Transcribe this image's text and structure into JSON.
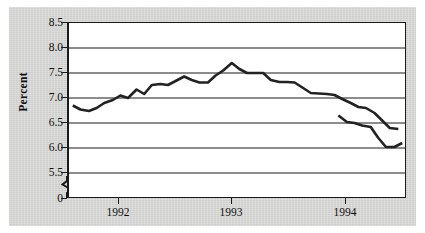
{
  "figure": {
    "name": "unemployment-rate-line-chart",
    "background_color": "#d6d6d4",
    "plot_background_color": "#ffffff",
    "line_color": "#222222",
    "axis_color": "#1a1a1a"
  },
  "chart_data": {
    "type": "line",
    "title": "",
    "xlabel": "",
    "ylabel": "Percent",
    "ylim": [
      5.25,
      8.5
    ],
    "yticks": [
      "0",
      "5.5",
      "6.0",
      "6.5",
      "7.0",
      "7.5",
      "8.0",
      "8.5"
    ],
    "ytick_values": [
      0,
      5.5,
      6.0,
      6.5,
      7.0,
      7.5,
      8.0,
      8.5
    ],
    "axis_break": true,
    "axis_break_between": [
      0,
      5.5
    ],
    "grid": "horizontal",
    "legend": "none",
    "xticks": [
      "1992",
      "1993",
      "1994"
    ],
    "xtick_values": [
      1992,
      1993,
      1994
    ],
    "xlim": [
      1991.25,
      1994.78
    ],
    "series": [
      {
        "name": "Unemployment rate",
        "break_after_index": 30,
        "x": [
          1991.29,
          1991.37,
          1991.46,
          1991.54,
          1991.62,
          1991.71,
          1991.79,
          1991.87,
          1991.96,
          1992.04,
          1992.12,
          1992.21,
          1992.29,
          1992.37,
          1992.46,
          1992.54,
          1992.62,
          1992.71,
          1992.79,
          1992.87,
          1992.96,
          1993.04,
          1993.12,
          1993.21,
          1993.29,
          1993.37,
          1993.46,
          1993.54,
          1993.62,
          1993.71,
          1993.79,
          1993.96,
          1994.04,
          1994.12,
          1994.21,
          1994.29,
          1994.37,
          1994.46,
          1994.54,
          1994.62,
          1994.71
        ],
        "y": [
          6.85,
          6.77,
          6.74,
          6.8,
          6.9,
          6.96,
          7.05,
          7.0,
          7.17,
          7.08,
          7.26,
          7.28,
          7.26,
          7.34,
          7.43,
          7.36,
          7.31,
          7.31,
          7.45,
          7.55,
          7.7,
          7.58,
          7.5,
          7.5,
          7.5,
          7.36,
          7.32,
          7.32,
          7.31,
          7.2,
          7.1,
          7.08,
          7.06,
          6.98,
          6.9,
          6.82,
          6.8,
          6.7,
          6.55,
          6.4,
          6.38
        ]
      },
      {
        "name": "Unemployment rate (continued)",
        "x": [
          1994.08,
          1994.17,
          1994.25,
          1994.33,
          1994.42,
          1994.5,
          1994.58,
          1994.67,
          1994.75
        ],
        "y": [
          6.65,
          6.52,
          6.5,
          6.45,
          6.42,
          6.2,
          6.02,
          6.02,
          6.1
        ]
      }
    ]
  }
}
